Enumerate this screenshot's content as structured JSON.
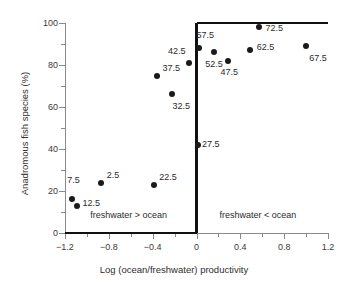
{
  "chart_data": {
    "type": "scatter",
    "title": "",
    "xlabel": "Log (ocean/freshwater) productivity",
    "ylabel": "Anadromous fish species (%)",
    "xlim": [
      -1.2,
      1.2
    ],
    "ylim": [
      0,
      100
    ],
    "xticks": [
      -1.2,
      -0.8,
      -0.4,
      0,
      0.4,
      0.8,
      1.2
    ],
    "xticklabels": [
      "−1.2",
      "−0.8",
      "−0.4",
      "0",
      "0.4",
      "0.8",
      "1.2"
    ],
    "xminor_step": 0.2,
    "yticks": [
      0,
      20,
      40,
      60,
      80,
      100
    ],
    "yticklabels": [
      "0",
      "20",
      "40",
      "60",
      "80",
      "100"
    ],
    "yminor_step": 10,
    "grid": false,
    "legend": "none",
    "points": [
      {
        "label": "7.5",
        "x": -1.14,
        "y": 16,
        "lx": -1.18,
        "ly": 25,
        "anchor": "left"
      },
      {
        "label": "12.5",
        "x": -1.09,
        "y": 13,
        "lx": -1.04,
        "ly": 14,
        "anchor": "left"
      },
      {
        "label": "2.5",
        "x": -0.87,
        "y": 24,
        "lx": -0.82,
        "ly": 27,
        "anchor": "left"
      },
      {
        "label": "22.5",
        "x": -0.39,
        "y": 23,
        "lx": -0.34,
        "ly": 26,
        "anchor": "left"
      },
      {
        "label": "32.5",
        "x": -0.22,
        "y": 66,
        "lx": -0.22,
        "ly": 60,
        "anchor": "left"
      },
      {
        "label": "37.5",
        "x": -0.36,
        "y": 75,
        "lx": -0.31,
        "ly": 78,
        "anchor": "left"
      },
      {
        "label": "42.5",
        "x": -0.07,
        "y": 81,
        "lx": -0.26,
        "ly": 86,
        "anchor": "left"
      },
      {
        "label": "27.5",
        "x": 0.01,
        "y": 42,
        "lx": 0.05,
        "ly": 42,
        "anchor": "left"
      },
      {
        "label": "57.5",
        "x": 0.02,
        "y": 88,
        "lx": 0.0,
        "ly": 94,
        "anchor": "left"
      },
      {
        "label": "52.5",
        "x": 0.16,
        "y": 86,
        "lx": 0.08,
        "ly": 80,
        "anchor": "left"
      },
      {
        "label": "47.5",
        "x": 0.29,
        "y": 82,
        "lx": 0.22,
        "ly": 76,
        "anchor": "left"
      },
      {
        "label": "62.5",
        "x": 0.49,
        "y": 87,
        "lx": 0.55,
        "ly": 88,
        "anchor": "left"
      },
      {
        "label": "72.5",
        "x": 0.57,
        "y": 98,
        "lx": 0.63,
        "ly": 97,
        "anchor": "left"
      },
      {
        "label": "67.5",
        "x": 1.0,
        "y": 89,
        "lx": 1.03,
        "ly": 83,
        "anchor": "left"
      }
    ],
    "step_line": {
      "description": "step function at x=0 separating regions",
      "vertices": [
        {
          "x": -1.2,
          "y": 0
        },
        {
          "x": 0,
          "y": 0
        },
        {
          "x": 0,
          "y": 100
        },
        {
          "x": 1.2,
          "y": 100
        }
      ],
      "color": "#111111"
    },
    "annotations": [
      {
        "name": "region-left",
        "text": "freshwater > ocean",
        "x": -0.62,
        "y": 8
      },
      {
        "name": "region-right",
        "text": "freshwater < ocean",
        "x": 0.56,
        "y": 8
      }
    ]
  }
}
